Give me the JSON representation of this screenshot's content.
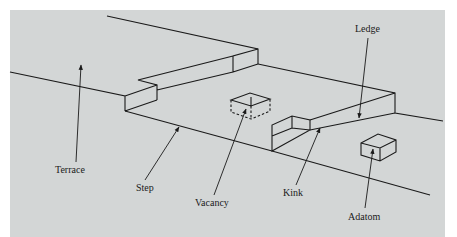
{
  "figure": {
    "type": "crystal surface model (terrace-ledge-kink)",
    "background_color": "#d3d6d6",
    "line_color": "#1a1a1a"
  },
  "labels": [
    {
      "id": "ledge",
      "text": "Ledge"
    },
    {
      "id": "terrace",
      "text": "Terrace"
    },
    {
      "id": "step",
      "text": "Step"
    },
    {
      "id": "vacancy",
      "text": "Vacancy"
    },
    {
      "id": "kink",
      "text": "Kink"
    },
    {
      "id": "adatom",
      "text": "Adatom"
    }
  ]
}
